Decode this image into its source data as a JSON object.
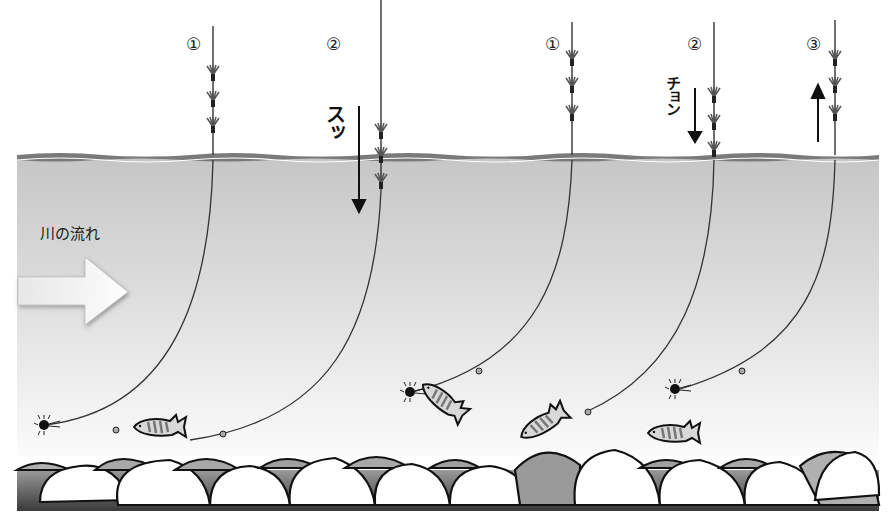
{
  "diagram": {
    "type": "fishing-illustration",
    "colors": {
      "water_top": "#c8c8c8",
      "water_bottom": "#f4f4f4",
      "surface_line": "#7a7a7a",
      "line": "#333333",
      "stone_light": "#ffffff",
      "stone_mid": "#b5b5b5",
      "riverbed": "#4a4a4a"
    },
    "flow": {
      "label": "川の流れ",
      "arrow": "right-arrow"
    },
    "rigs": [
      {
        "id": "rig-1",
        "marker": "①",
        "x": 213,
        "state": "above-surface"
      },
      {
        "id": "rig-2",
        "marker": "②",
        "x": 381,
        "state": "sinking",
        "sound": "スッ",
        "motion": "down"
      },
      {
        "id": "rig-3",
        "marker": "①",
        "x": 572,
        "state": "above-surface"
      },
      {
        "id": "rig-4",
        "marker": "②",
        "x": 714,
        "state": "touch-surface",
        "sound": "チョン",
        "motion": "down"
      },
      {
        "id": "rig-5",
        "marker": "③",
        "x": 835,
        "state": "rising",
        "motion": "up"
      }
    ],
    "fish_count": 5,
    "lure_count": 3
  }
}
